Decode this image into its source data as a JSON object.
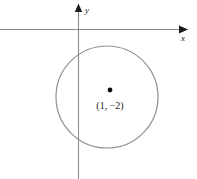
{
  "figure": {
    "kind": "coordinate-plane-circle-diagram",
    "width": 197,
    "height": 179,
    "background_color": "#ffffff"
  },
  "axes": {
    "x_axis_label": "x",
    "y_axis_label": "y",
    "axis_color": "#8a8a8a",
    "arrow_color": "#1a1a1a",
    "label_color": "#1a1a1a",
    "x_axis_y_position": 29,
    "y_axis_x_position": 78,
    "x_axis_arrow_tip_x": 187,
    "y_axis_arrow_tip_y": 4
  },
  "circle": {
    "center_x": 107,
    "center_y": 97,
    "radius": 51,
    "stroke_color": "#8f8f8f",
    "stroke_width": 1.2,
    "fill": "none"
  },
  "center_point": {
    "label": "(1, −2)",
    "dot_x": 110,
    "dot_y": 90,
    "dot_radius": 2.4,
    "dot_color": "#111111",
    "label_x": 110,
    "label_y": 109
  }
}
